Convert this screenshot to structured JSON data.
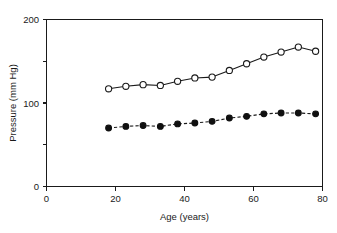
{
  "chart_data": {
    "type": "line",
    "title": "",
    "subtitle": "",
    "xlabel": "Age (years)",
    "ylabel": "Pressure (mm Hg)",
    "xlim": [
      0,
      80
    ],
    "ylim": [
      0,
      200
    ],
    "x_ticks": [
      0,
      20,
      40,
      60,
      80
    ],
    "x_tick_labels": [
      "0",
      "20",
      "40",
      "60",
      "80"
    ],
    "x_minor_ticks": [],
    "y_ticks": [
      0,
      100,
      200
    ],
    "y_tick_labels": [
      "0",
      "100",
      "200"
    ],
    "y_minor_ticks": [
      50,
      150
    ],
    "grid": false,
    "legend": "none",
    "frame": "box-top-right",
    "x": [
      18,
      23,
      28,
      33,
      38,
      43,
      48,
      53,
      58,
      63,
      68,
      73,
      78
    ],
    "series": [
      {
        "name": "Systolic pressure",
        "marker": "open-circle",
        "line_style": "solid",
        "values": [
          117,
          120,
          122,
          121,
          126,
          130,
          131,
          139,
          147,
          155,
          161,
          167,
          162
        ]
      },
      {
        "name": "Diastolic pressure",
        "marker": "filled-circle",
        "line_style": "dashed",
        "values": [
          70,
          72,
          73,
          72,
          75,
          76,
          78,
          82,
          84,
          87,
          88,
          88,
          87
        ]
      }
    ],
    "annotations": [],
    "colors": {
      "axis": "#1a1a1a",
      "line": "#1a1a1a",
      "marker_open_fill": "#ffffff",
      "marker_filled_fill": "#101010",
      "background": "#ffffff"
    }
  },
  "axes": {
    "y_label_200": "200",
    "y_label_100": "100",
    "y_label_0": "0",
    "x_label_0": "0",
    "x_label_20": "20",
    "x_label_40": "40",
    "x_label_60": "60",
    "x_label_80": "80",
    "x_title": "Age (years)",
    "y_title": "Pressure (mm Hg)"
  }
}
